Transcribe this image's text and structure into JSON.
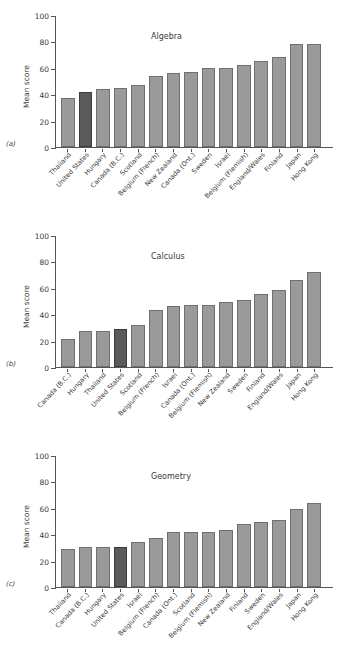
{
  "figure": {
    "ylabel": "Mean score",
    "yticks": [
      0,
      20,
      40,
      60,
      80,
      100
    ],
    "ylim": [
      0,
      100
    ],
    "bar_color": "#9a9a9a",
    "highlight_color": "#5a5a5a",
    "highlight_label": "United States"
  },
  "panels": [
    {
      "letter": "(a)",
      "title": "Algebra",
      "ylabel": "Mean score"
    },
    {
      "letter": "(b)",
      "title": "Calculus",
      "ylabel": "Mean score"
    },
    {
      "letter": "(c)",
      "title": "Geometry",
      "ylabel": "Mean score"
    }
  ],
  "chart_data": [
    {
      "type": "bar",
      "title": "Algebra",
      "panel": "(a)",
      "xlabel": "",
      "ylabel": "Mean score",
      "ylim": [
        0,
        100
      ],
      "yticks": [
        0,
        20,
        40,
        60,
        80,
        100
      ],
      "grid": false,
      "legend": "none",
      "highlight": "United States",
      "categories": [
        "Thailand",
        "United States",
        "Hungary",
        "Canada (B.C.)",
        "Scotland",
        "Belgium (French)",
        "New Zealand",
        "Canada (Ont.)",
        "Sweden",
        "Israel",
        "Belgium (Flemish)",
        "England/Wales",
        "Finland",
        "Japan",
        "Hong Kong"
      ],
      "values": [
        37,
        42,
        44,
        45,
        47,
        54,
        56,
        57,
        60,
        60,
        62,
        65,
        68,
        78,
        78
      ]
    },
    {
      "type": "bar",
      "title": "Calculus",
      "panel": "(b)",
      "xlabel": "",
      "ylabel": "Mean score",
      "ylim": [
        0,
        100
      ],
      "yticks": [
        0,
        20,
        40,
        60,
        80,
        100
      ],
      "grid": false,
      "legend": "none",
      "highlight": "United States",
      "categories": [
        "Canada (B.C.)",
        "Hungary",
        "Thailand",
        "United States",
        "Scotland",
        "Belgium (French)",
        "Israel",
        "Canada (Ont.)",
        "Belgium (Flemish)",
        "New Zealand",
        "Sweden",
        "Finland",
        "England/Wales",
        "Japan",
        "Hong Kong"
      ],
      "values": [
        21,
        27,
        27,
        29,
        32,
        43,
        46,
        47,
        47,
        49,
        51,
        55,
        58,
        66,
        72
      ]
    },
    {
      "type": "bar",
      "title": "Geometry",
      "panel": "(c)",
      "xlabel": "",
      "ylabel": "Mean score",
      "ylim": [
        0,
        100
      ],
      "yticks": [
        0,
        20,
        40,
        60,
        80,
        100
      ],
      "grid": false,
      "legend": "none",
      "highlight": "United States",
      "categories": [
        "Thailand",
        "Canada (B.C.)",
        "Hungary",
        "United States",
        "Israel",
        "Belgium (French)",
        "Canada (Ont.)",
        "Scotland",
        "Belgium (Flemish)",
        "New Zealand",
        "Finland",
        "Sweden",
        "England/Wales",
        "Japan",
        "Hong Kong"
      ],
      "values": [
        29,
        30,
        30,
        30,
        34,
        37,
        42,
        42,
        42,
        43,
        48,
        49,
        51,
        59,
        64
      ]
    }
  ]
}
